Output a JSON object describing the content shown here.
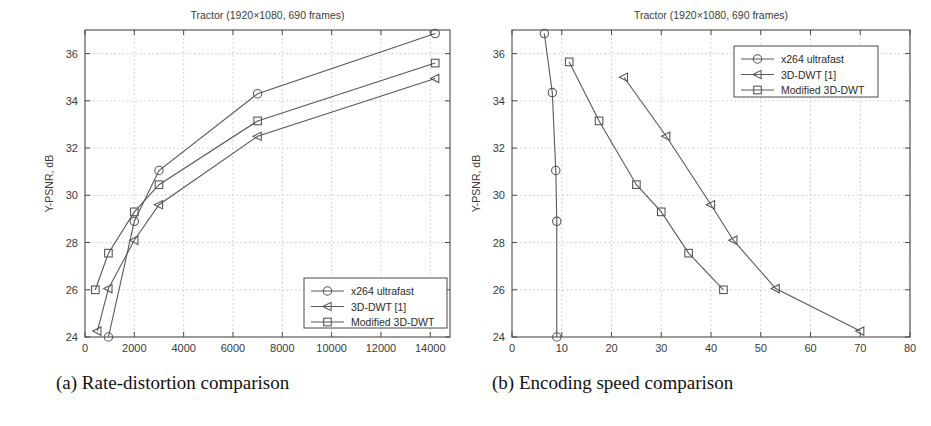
{
  "figure": {
    "caption_a": "(a) Rate-distortion comparison",
    "caption_b": "(b) Encoding speed comparison"
  },
  "legend_entries": [
    {
      "label": "x264 ultrafast",
      "marker": "circle"
    },
    {
      "label": "3D-DWT [1]",
      "marker": "triangle-left"
    },
    {
      "label": "Modified 3D-DWT",
      "marker": "square"
    }
  ],
  "chart_data": [
    {
      "id": "rate-distortion",
      "type": "line",
      "title": "Tractor (1920×1080, 690 frames)",
      "xlabel": "bit rate, kbps",
      "ylabel": "Y-PSNR, dB",
      "xlim": [
        0,
        14800
      ],
      "ylim": [
        24,
        37
      ],
      "xticks": [
        0,
        2000,
        4000,
        6000,
        8000,
        10000,
        12000,
        14000
      ],
      "xtick_labels": [
        "0",
        "2000",
        "4000",
        "6000",
        "8000",
        "10000",
        "12000",
        "14000"
      ],
      "yticks": [
        24,
        26,
        28,
        30,
        32,
        34,
        36
      ],
      "ytick_labels": [
        "24",
        "26",
        "28",
        "30",
        "32",
        "34",
        "36"
      ],
      "grid": true,
      "legend_position": "lower-right",
      "series": [
        {
          "name": "x264 ultrafast",
          "marker": "circle",
          "x": [
            950,
            2000,
            3000,
            7000,
            14200
          ],
          "y": [
            24.0,
            28.9,
            31.05,
            34.3,
            36.85
          ]
        },
        {
          "name": "3D-DWT [1]",
          "marker": "triangle-left",
          "x": [
            500,
            950,
            2000,
            3000,
            7000,
            14200
          ],
          "y": [
            24.25,
            26.05,
            28.1,
            29.6,
            32.5,
            34.95
          ]
        },
        {
          "name": "Modified 3D-DWT",
          "marker": "square",
          "x": [
            420,
            950,
            2000,
            3000,
            7000,
            14200
          ],
          "y": [
            26.0,
            27.55,
            29.3,
            30.45,
            33.15,
            35.6
          ]
        }
      ]
    },
    {
      "id": "encoding-speed",
      "type": "line",
      "title": "Tractor (1920×1080, 690 frames)",
      "xlabel": "encoding speed, fps",
      "ylabel": "Y-PSNR, dB",
      "xlim": [
        0,
        80
      ],
      "ylim": [
        24,
        37
      ],
      "xticks": [
        0,
        10,
        20,
        30,
        40,
        50,
        60,
        70,
        80
      ],
      "xtick_labels": [
        "0",
        "10",
        "20",
        "30",
        "40",
        "50",
        "60",
        "70",
        "80"
      ],
      "yticks": [
        24,
        26,
        28,
        30,
        32,
        34,
        36
      ],
      "ytick_labels": [
        "24",
        "26",
        "28",
        "30",
        "32",
        "34",
        "36"
      ],
      "grid": true,
      "legend_position": "upper-right",
      "series": [
        {
          "name": "x264 ultrafast",
          "marker": "circle",
          "x": [
            6.5,
            8.1,
            8.8,
            9.0,
            9.0
          ],
          "y": [
            36.85,
            34.35,
            31.05,
            28.9,
            24.0
          ]
        },
        {
          "name": "3D-DWT [1]",
          "marker": "triangle-left",
          "x": [
            22.5,
            31.0,
            40.0,
            44.5,
            53.0,
            70.0
          ],
          "y": [
            35.0,
            32.5,
            29.6,
            28.1,
            26.05,
            24.25
          ]
        },
        {
          "name": "Modified 3D-DWT",
          "marker": "square",
          "x": [
            11.5,
            17.5,
            25.0,
            30.0,
            35.5,
            42.5
          ],
          "y": [
            35.65,
            33.15,
            30.45,
            29.3,
            27.55,
            26.0
          ]
        }
      ]
    }
  ],
  "colors": {
    "line": "#585858",
    "axis": "#4a4a4a",
    "grid": "#bdbdbd",
    "text": "#3a3a3a",
    "background": "#ffffff"
  }
}
